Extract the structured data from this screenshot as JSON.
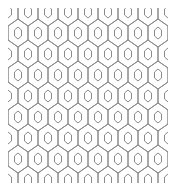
{
  "image": {
    "description": "Seamless hexagonal lattice pattern with nested inner hexagons",
    "background": "#ffffff",
    "line_color": "#8a8a8a",
    "pattern": {
      "type": "hexagon-lattice",
      "orientation": "pointy-top",
      "cell_width": 20,
      "row_spacing": 21,
      "cell_height": 28,
      "inner_shape": "hexagon",
      "inner_width": 7,
      "inner_height": 12,
      "stroke_width": 1
    },
    "bounds": {
      "x": 8,
      "y": 8,
      "width": 160,
      "height": 175
    }
  }
}
